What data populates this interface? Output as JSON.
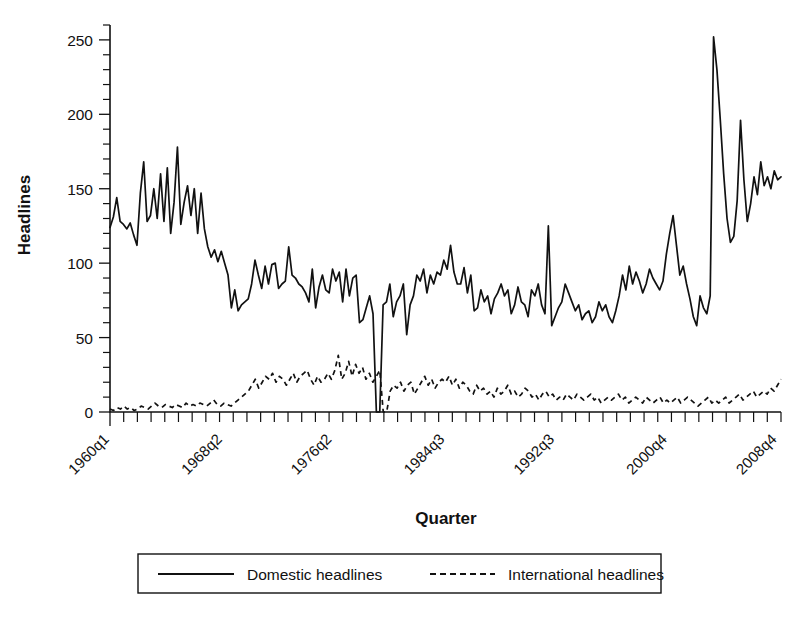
{
  "chart_data": {
    "type": "line",
    "title": "",
    "xlabel": "Quarter",
    "ylabel": "Headlines",
    "ylim": [
      0,
      260
    ],
    "yticks": [
      0,
      50,
      100,
      150,
      200,
      250
    ],
    "ytick_labels": [
      "0",
      "50",
      "100",
      "150",
      "200",
      "250"
    ],
    "y_minor_tick_step": 10,
    "grid": false,
    "x_label_rotation_deg": 45,
    "x_tick_labels": [
      "1960q1",
      "1968q2",
      "1976q2",
      "1984q3",
      "1992q3",
      "2000q4",
      "2008q4"
    ],
    "x_label_indices": [
      0,
      33,
      65,
      98,
      130,
      163,
      195
    ],
    "x_index_range": [
      0,
      196
    ],
    "x_minor_tick_every_n_quarters": 4,
    "legend": {
      "position": "below-axis",
      "entries": [
        {
          "label": "Domestic headlines",
          "style": "solid"
        },
        {
          "label": "International headlines",
          "style": "dashed"
        }
      ]
    },
    "series": [
      {
        "name": "Domestic headlines",
        "style": "solid",
        "values": [
          124,
          131,
          144,
          128,
          126,
          123,
          127,
          119,
          112,
          147,
          168,
          128,
          132,
          150,
          130,
          160,
          128,
          164,
          120,
          141,
          178,
          126,
          141,
          152,
          132,
          150,
          120,
          147,
          123,
          111,
          104,
          109,
          101,
          108,
          100,
          92,
          70,
          82,
          68,
          72,
          74,
          76,
          86,
          102,
          92,
          83,
          98,
          86,
          99,
          100,
          83,
          86,
          88,
          111,
          92,
          90,
          86,
          84,
          80,
          74,
          96,
          70,
          84,
          92,
          82,
          80,
          96,
          88,
          94,
          74,
          96,
          78,
          90,
          92,
          60,
          62,
          70,
          78,
          66,
          0,
          0,
          72,
          74,
          86,
          64,
          74,
          78,
          86,
          52,
          72,
          78,
          92,
          88,
          96,
          80,
          92,
          86,
          94,
          92,
          102,
          96,
          112,
          94,
          86,
          86,
          97,
          80,
          92,
          68,
          70,
          82,
          74,
          78,
          66,
          76,
          80,
          86,
          78,
          82,
          66,
          72,
          84,
          74,
          72,
          64,
          82,
          78,
          86,
          72,
          66,
          125,
          58,
          64,
          70,
          74,
          86,
          80,
          74,
          68,
          72,
          62,
          66,
          68,
          60,
          64,
          74,
          68,
          72,
          64,
          60,
          68,
          78,
          92,
          82,
          98,
          86,
          94,
          88,
          80,
          86,
          96,
          90,
          86,
          82,
          88,
          106,
          120,
          132,
          112,
          92,
          98,
          86,
          76,
          64,
          58,
          78,
          70,
          66,
          78,
          252,
          230,
          196,
          160,
          130,
          114,
          118,
          142,
          196,
          156,
          128,
          140,
          158,
          146,
          168,
          152,
          158,
          150,
          162,
          156,
          158
        ]
      },
      {
        "name": "International headlines",
        "style": "dashed",
        "values": [
          2,
          1,
          3,
          2,
          4,
          2,
          3,
          1,
          2,
          4,
          3,
          2,
          4,
          6,
          4,
          3,
          5,
          4,
          3,
          5,
          4,
          3,
          6,
          4,
          5,
          4,
          6,
          5,
          4,
          6,
          8,
          5,
          4,
          6,
          5,
          4,
          6,
          8,
          10,
          12,
          14,
          18,
          22,
          16,
          20,
          24,
          22,
          26,
          20,
          24,
          22,
          18,
          22,
          26,
          20,
          24,
          26,
          28,
          22,
          18,
          24,
          20,
          22,
          26,
          22,
          28,
          38,
          22,
          26,
          34,
          24,
          32,
          26,
          30,
          22,
          26,
          20,
          24,
          28,
          0,
          0,
          14,
          18,
          16,
          20,
          14,
          18,
          20,
          12,
          16,
          20,
          24,
          18,
          22,
          16,
          20,
          22,
          20,
          24,
          18,
          22,
          16,
          20,
          18,
          14,
          12,
          18,
          14,
          16,
          12,
          14,
          10,
          16,
          12,
          14,
          18,
          12,
          14,
          10,
          12,
          16,
          14,
          10,
          12,
          8,
          12,
          14,
          10,
          12,
          8,
          10,
          8,
          12,
          10,
          8,
          12,
          10,
          8,
          10,
          12,
          8,
          10,
          6,
          8,
          10,
          8,
          10,
          12,
          8,
          10,
          6,
          8,
          10,
          8,
          6,
          10,
          8,
          6,
          8,
          10,
          6,
          8,
          6,
          8,
          10,
          6,
          8,
          10,
          8,
          6,
          4,
          6,
          8,
          10,
          6,
          8,
          6,
          8,
          10,
          6,
          8,
          10,
          12,
          8,
          10,
          12,
          14,
          10,
          12,
          14,
          12,
          16,
          14,
          18,
          22
        ]
      }
    ]
  }
}
